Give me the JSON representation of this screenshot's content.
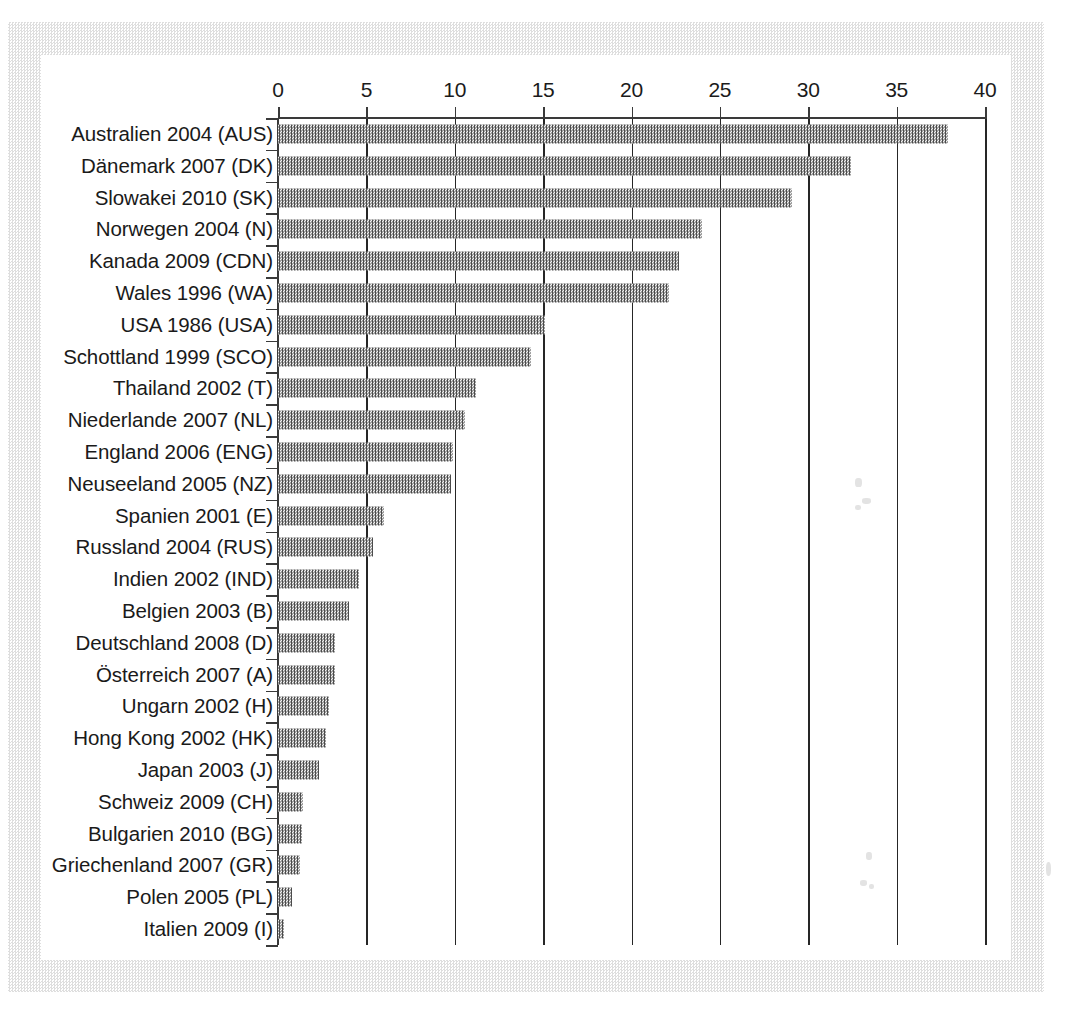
{
  "chart_data": {
    "type": "bar",
    "orientation": "horizontal",
    "title": "",
    "subtitle": "",
    "xlabel": "",
    "ylabel": "",
    "xlim": [
      0,
      40
    ],
    "xticks": [
      0,
      5,
      10,
      15,
      20,
      25,
      30,
      35,
      40
    ],
    "xtick_labels": [
      "0",
      "5",
      "10",
      "15",
      "20",
      "25",
      "30",
      "35",
      "40"
    ],
    "grid": true,
    "grid_axis": "x",
    "legend": false,
    "bar_fill": "checkerboard-dither-gray",
    "bar_color": "#4b4b4b",
    "axis_color": "#3a3a3a",
    "categories": [
      "Australien 2004 (AUS)",
      "Dänemark 2007 (DK)",
      "Slowakei 2010 (SK)",
      "Norwegen 2004 (N)",
      "Kanada 2009 (CDN)",
      "Wales 1996 (WA)",
      "USA 1986 (USA)",
      "Schottland 1999 (SCO)",
      "Thailand 2002 (T)",
      "Niederlande 2007 (NL)",
      "England 2006 (ENG)",
      "Neuseeland 2005 (NZ)",
      "Spanien 2001 (E)",
      "Russland 2004 (RUS)",
      "Indien 2002 (IND)",
      "Belgien 2003 (B)",
      "Deutschland 2008 (D)",
      "Österreich 2007 (A)",
      "Ungarn 2002 (H)",
      "Hong Kong 2002 (HK)",
      "Japan 2003 (J)",
      "Schweiz 2009 (CH)",
      "Bulgarien 2010 (BG)",
      "Griechenland 2007 (GR)",
      "Polen 2005 (PL)",
      "Italien 2009 (I)"
    ],
    "values": [
      37.9,
      32.4,
      29.1,
      24.0,
      22.7,
      22.1,
      15.1,
      14.3,
      11.2,
      10.6,
      9.9,
      9.8,
      6.0,
      5.4,
      4.6,
      4.0,
      3.2,
      3.2,
      2.9,
      2.7,
      2.3,
      1.4,
      1.35,
      1.25,
      0.8,
      0.35
    ]
  }
}
